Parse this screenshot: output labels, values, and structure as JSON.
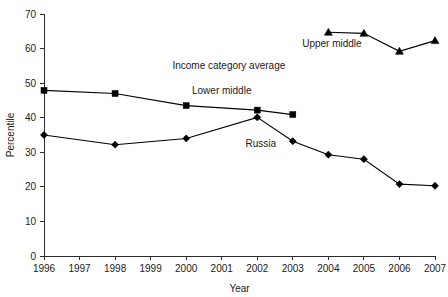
{
  "chart_data": {
    "type": "line",
    "title": "",
    "xlabel": "Year",
    "ylabel": "Percentile",
    "xlim": [
      1996,
      2007
    ],
    "ylim": [
      0,
      70
    ],
    "grid": false,
    "legend": "inline-labels",
    "x_ticks": [
      "1996",
      "1997",
      "1998",
      "1999",
      "2000",
      "2001",
      "2002",
      "2003",
      "2004",
      "2005",
      "2006",
      "2007"
    ],
    "y_ticks": [
      "0",
      "10",
      "20",
      "30",
      "40",
      "50",
      "60",
      "70"
    ],
    "annotations": [
      {
        "text": "Income category average",
        "x": 2001.2,
        "y": 54.0
      },
      {
        "text": "Upper middle",
        "x": 2004.1,
        "y": 60.5
      },
      {
        "text": "Lower middle",
        "x": 2001.0,
        "y": 47.0
      },
      {
        "text": "Russia",
        "x": 2002.1,
        "y": 31.5
      }
    ],
    "series": [
      {
        "name": "Upper middle",
        "marker": "triangle",
        "x": [
          2004,
          2005,
          2006,
          2007
        ],
        "values": [
          64.7,
          64.4,
          59.2,
          62.3
        ]
      },
      {
        "name": "Lower middle",
        "marker": "square",
        "x": [
          1996,
          1998,
          2000,
          2002,
          2003
        ],
        "values": [
          47.9,
          47.0,
          43.5,
          42.2,
          40.9
        ]
      },
      {
        "name": "Russia",
        "marker": "diamond",
        "x": [
          1996,
          1998,
          2000,
          2002,
          2003,
          2004,
          2005,
          2006,
          2007
        ],
        "values": [
          35.0,
          32.2,
          34.0,
          40.1,
          33.2,
          29.3,
          28.0,
          20.8,
          20.3
        ]
      }
    ]
  },
  "colors": {
    "axis": "#2b2b2b",
    "line": "#000000",
    "text": "#1a1a1a",
    "background": "#ffffff"
  }
}
